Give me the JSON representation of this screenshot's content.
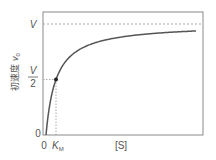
{
  "chart_data": {
    "type": "line",
    "title": "",
    "xlabel": "[S]",
    "ylabel": "初速度 v0",
    "ylabel_main": "初速度",
    "ylabel_var": "v",
    "ylabel_sub": "0",
    "x_ticks": [
      "0",
      "K_M"
    ],
    "x_tick_zero": "0",
    "x_tick_km": "K",
    "x_tick_km_sub": "M",
    "y_ticks": [
      "0",
      "V/2",
      "V"
    ],
    "y_tick_zero": "0",
    "y_tick_half_num": "V",
    "y_tick_half_den": "2",
    "y_tick_max": "V",
    "series": [
      {
        "name": "Michaelis-Menten curve",
        "equation": "v0 = V[S]/(K_M + [S])",
        "x_relative_to_KM": [
          0,
          0.5,
          1,
          2,
          4,
          6,
          8,
          10,
          15
        ],
        "y_relative_to_V": [
          0,
          0.333,
          0.5,
          0.667,
          0.8,
          0.857,
          0.889,
          0.909,
          0.9375
        ]
      }
    ],
    "annotations": [
      {
        "type": "dashed-hline",
        "at": "V"
      },
      {
        "type": "dotted-guide",
        "point": [
          "K_M",
          "V/2"
        ]
      },
      {
        "type": "marker",
        "point": [
          "K_M",
          "V/2"
        ]
      }
    ],
    "grid": false,
    "legend": null
  },
  "colors": {
    "axis": "#888888",
    "curve": "#555555",
    "guide": "#aaaaaa",
    "text": "#555555"
  }
}
